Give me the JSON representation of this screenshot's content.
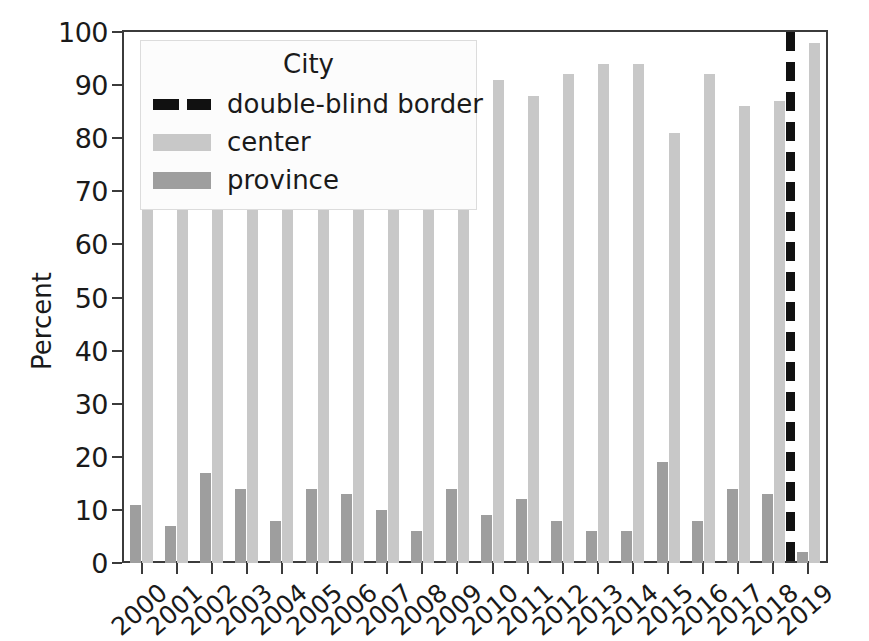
{
  "chart_data": {
    "type": "bar",
    "title": "",
    "xlabel": "",
    "ylabel": "Percent",
    "ylim": [
      0,
      100
    ],
    "yticks": [
      0,
      10,
      20,
      30,
      40,
      50,
      60,
      70,
      80,
      90,
      100
    ],
    "grid": false,
    "legend": {
      "title": "City",
      "position": "upper left",
      "entries": [
        {
          "label": "double-blind border",
          "style": "dashed-line",
          "color": "#111111"
        },
        {
          "label": "center",
          "style": "bar",
          "color": "#c8c8c8"
        },
        {
          "label": "province",
          "style": "bar",
          "color": "#9e9e9e"
        }
      ]
    },
    "categories": [
      "2000",
      "2001",
      "2002",
      "2003",
      "2004",
      "2005",
      "2006",
      "2007",
      "2008",
      "2009",
      "2010",
      "2011",
      "2012",
      "2013",
      "2014",
      "2015",
      "2016",
      "2017",
      "2018",
      "2019"
    ],
    "series": [
      {
        "name": "center",
        "color": "#c8c8c8",
        "values": [
          89,
          89,
          89,
          89,
          89,
          89,
          89,
          89,
          94,
          86,
          91,
          88,
          92,
          94,
          94,
          81,
          92,
          86,
          87,
          98
        ]
      },
      {
        "name": "province",
        "color": "#9e9e9e",
        "values": [
          11,
          7,
          17,
          14,
          8,
          14,
          13,
          10,
          6,
          14,
          9,
          12,
          8,
          6,
          6,
          19,
          8,
          14,
          13,
          2
        ]
      }
    ],
    "annotations": [
      {
        "type": "vline",
        "label": "double-blind border",
        "between": [
          "2018",
          "2019"
        ],
        "style": "dashed",
        "color": "#111111"
      }
    ]
  }
}
